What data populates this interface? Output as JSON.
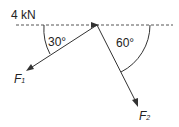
{
  "diagram": {
    "force_label": "4 kN",
    "angle1": "30°",
    "angle2": "60°",
    "f1": {
      "symbol": "F",
      "subscript": "1"
    },
    "f2": {
      "symbol": "F",
      "subscript": "2"
    },
    "colors": {
      "line": "#333333"
    }
  }
}
